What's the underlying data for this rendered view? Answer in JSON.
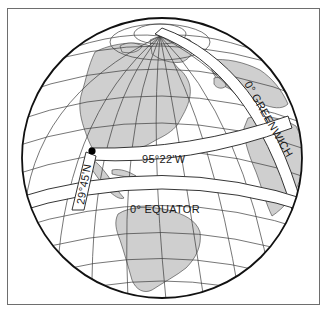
{
  "figure": {
    "type": "globe-diagram",
    "land_color": "#cfcfcf",
    "line_color": "#1f1f1f",
    "background": "#ffffff"
  },
  "labels": {
    "greenwich": "0° GREENWICH",
    "meridian_95": "95°22'W",
    "latitude_29": "29°45'N",
    "equator": "0° EQUATOR"
  },
  "marker": {
    "name": "location-point",
    "latitude": "29°45'N",
    "longitude": "95°22'W"
  }
}
